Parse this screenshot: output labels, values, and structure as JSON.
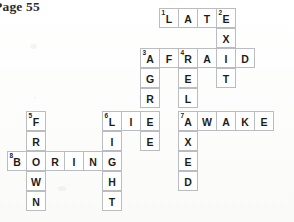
{
  "header": {
    "page_label": "Page 55"
  },
  "puzzle": {
    "type": "crossword",
    "cell_size": 20,
    "title": "",
    "answers_across": [
      {
        "number": "1",
        "answer": "LATE"
      },
      {
        "number": "3",
        "answer": "AFRAID"
      },
      {
        "number": "6",
        "answer": "LIE"
      },
      {
        "number": "7",
        "answer": "AWAKE"
      },
      {
        "number": "8",
        "answer": "BORING"
      }
    ],
    "answers_down": [
      {
        "number": "2",
        "answer": "EXIT"
      },
      {
        "number": "3",
        "answer": "AGREE"
      },
      {
        "number": "4",
        "answer": "RELAXED"
      },
      {
        "number": "5",
        "answer": "FROWN"
      },
      {
        "number": "6",
        "answer": "LIGHT"
      }
    ],
    "cells": [
      {
        "col": 8,
        "row": 0,
        "letter": "L",
        "num": "1"
      },
      {
        "col": 9,
        "row": 0,
        "letter": "A",
        "num": ""
      },
      {
        "col": 10,
        "row": 0,
        "letter": "T",
        "num": ""
      },
      {
        "col": 11,
        "row": 0,
        "letter": "E",
        "num": "2"
      },
      {
        "col": 11,
        "row": 1,
        "letter": "X",
        "num": ""
      },
      {
        "col": 7,
        "row": 2,
        "letter": "A",
        "num": "3"
      },
      {
        "col": 8,
        "row": 2,
        "letter": "F",
        "num": ""
      },
      {
        "col": 9,
        "row": 2,
        "letter": "R",
        "num": "4"
      },
      {
        "col": 10,
        "row": 2,
        "letter": "A",
        "num": ""
      },
      {
        "col": 11,
        "row": 2,
        "letter": "I",
        "num": ""
      },
      {
        "col": 12,
        "row": 2,
        "letter": "D",
        "num": ""
      },
      {
        "col": 7,
        "row": 3,
        "letter": "G",
        "num": ""
      },
      {
        "col": 9,
        "row": 3,
        "letter": "E",
        "num": ""
      },
      {
        "col": 11,
        "row": 3,
        "letter": "T",
        "num": ""
      },
      {
        "col": 7,
        "row": 4,
        "letter": "R",
        "num": ""
      },
      {
        "col": 9,
        "row": 4,
        "letter": "L",
        "num": ""
      },
      {
        "col": 1,
        "row": 5,
        "letter": "F",
        "num": "5"
      },
      {
        "col": 5,
        "row": 5,
        "letter": "L",
        "num": "6"
      },
      {
        "col": 6,
        "row": 5,
        "letter": "I",
        "num": ""
      },
      {
        "col": 7,
        "row": 5,
        "letter": "E",
        "num": ""
      },
      {
        "col": 9,
        "row": 5,
        "letter": "A",
        "num": "7"
      },
      {
        "col": 10,
        "row": 5,
        "letter": "W",
        "num": ""
      },
      {
        "col": 11,
        "row": 5,
        "letter": "A",
        "num": ""
      },
      {
        "col": 12,
        "row": 5,
        "letter": "K",
        "num": ""
      },
      {
        "col": 13,
        "row": 5,
        "letter": "E",
        "num": ""
      },
      {
        "col": 1,
        "row": 6,
        "letter": "R",
        "num": ""
      },
      {
        "col": 5,
        "row": 6,
        "letter": "I",
        "num": ""
      },
      {
        "col": 7,
        "row": 6,
        "letter": "E",
        "num": ""
      },
      {
        "col": 9,
        "row": 6,
        "letter": "X",
        "num": ""
      },
      {
        "col": 0,
        "row": 7,
        "letter": "B",
        "num": "8"
      },
      {
        "col": 1,
        "row": 7,
        "letter": "O",
        "num": ""
      },
      {
        "col": 2,
        "row": 7,
        "letter": "R",
        "num": ""
      },
      {
        "col": 3,
        "row": 7,
        "letter": "I",
        "num": ""
      },
      {
        "col": 4,
        "row": 7,
        "letter": "N",
        "num": ""
      },
      {
        "col": 5,
        "row": 7,
        "letter": "G",
        "num": ""
      },
      {
        "col": 9,
        "row": 7,
        "letter": "E",
        "num": ""
      },
      {
        "col": 1,
        "row": 8,
        "letter": "W",
        "num": ""
      },
      {
        "col": 5,
        "row": 8,
        "letter": "H",
        "num": ""
      },
      {
        "col": 9,
        "row": 8,
        "letter": "D",
        "num": ""
      },
      {
        "col": 1,
        "row": 9,
        "letter": "N",
        "num": ""
      },
      {
        "col": 5,
        "row": 9,
        "letter": "T",
        "num": ""
      }
    ]
  }
}
